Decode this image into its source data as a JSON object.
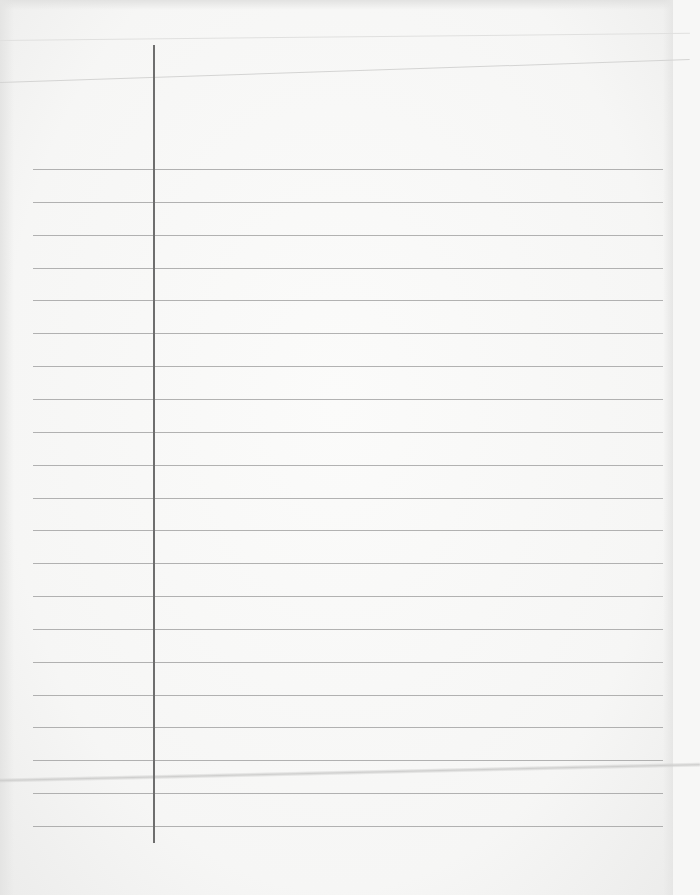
{
  "image": {
    "description": "blank ruled notebook paper",
    "paper_color": "#f7f7f6",
    "rule_color": "#9a9a9a",
    "margin_line_color": "#6e6e6e",
    "rules": {
      "count": 21,
      "first_y": 169,
      "spacing": 32.85,
      "left_x": 33,
      "right_x": 663
    },
    "margin_line": {
      "x": 153,
      "top_y": 45,
      "bottom_y": 843
    }
  }
}
